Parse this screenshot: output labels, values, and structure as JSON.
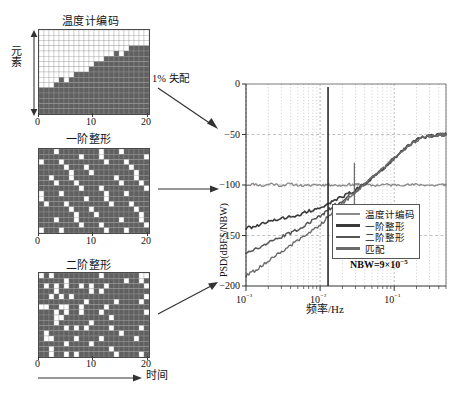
{
  "figure": {
    "panels": [
      {
        "id": "thermometer",
        "title": "温度计编码",
        "y_axis_label": "元素",
        "x_ticks": [
          "0",
          "10",
          "20"
        ]
      },
      {
        "id": "first-order",
        "title": "一阶整形",
        "x_ticks": [
          "0",
          "10",
          "20"
        ]
      },
      {
        "id": "second-order",
        "title": "二阶整形",
        "x_ticks": [
          "0",
          "10",
          "20"
        ]
      }
    ],
    "time_axis_label": "时间",
    "mismatch_annotation": "1%  失配"
  },
  "chart_data": {
    "type": "line",
    "title": "",
    "xlabel": "频率/Hz",
    "ylabel": "PSD(dBFS/NBW)",
    "xscale": "log",
    "xlim": [
      0.001,
      0.5
    ],
    "ylim": [
      -200,
      0
    ],
    "yticks": [
      0,
      -50,
      -100,
      -150,
      -200
    ],
    "ytick_labels": [
      "0",
      "−50",
      "−100",
      "−150",
      "−200"
    ],
    "xticks": [
      0.001,
      0.01,
      0.1
    ],
    "xtick_labels": [
      "10⁻³",
      "10⁻²",
      "10⁻¹"
    ],
    "grid": true,
    "annotation": "NBW=9×10",
    "annotation_exponent": "−5",
    "legend_position": "lower-right-inside",
    "series": [
      {
        "name": "温度计编码",
        "color": "#8a8a8a",
        "width": 1.3,
        "x": [
          0.001,
          0.0013,
          0.0017,
          0.0022,
          0.0029,
          0.0038,
          0.005,
          0.0065,
          0.0085,
          0.011,
          0.0128,
          0.0145,
          0.019,
          0.025,
          0.029,
          0.033,
          0.043,
          0.056,
          0.073,
          0.095,
          0.12,
          0.16,
          0.21,
          0.27,
          0.35,
          0.45,
          0.5
        ],
        "y": [
          -100,
          -99,
          -101,
          -98.5,
          -100.5,
          -99,
          -100,
          -101,
          -99.5,
          -100,
          -99.5,
          -100,
          -100.5,
          -99.5,
          -100,
          -99,
          -100,
          -100.5,
          -99.5,
          -100,
          -99.5,
          -100,
          -99.5,
          -100,
          -100.5,
          -99.5,
          -100
        ]
      },
      {
        "name": "一阶整形",
        "color": "#3a3a3a",
        "width": 1.6,
        "x": [
          0.001,
          0.0013,
          0.0017,
          0.0022,
          0.0029,
          0.0038,
          0.005,
          0.0065,
          0.0085,
          0.011,
          0.0128,
          0.016,
          0.021,
          0.027,
          0.035,
          0.045,
          0.058,
          0.075,
          0.098,
          0.13,
          0.17,
          0.22,
          0.29,
          0.38,
          0.45,
          0.5
        ],
        "y": [
          -143,
          -141,
          -138.5,
          -136,
          -133,
          -131.5,
          -130,
          -127,
          -124,
          -121,
          -118.5,
          -115,
          -111,
          -107,
          -102,
          -96,
          -89,
          -82,
          -74,
          -66,
          -59,
          -54,
          -51.5,
          -50.5,
          -50.2,
          -50
        ]
      },
      {
        "name": "二阶整形",
        "color": "#555555",
        "width": 1.5,
        "x": [
          0.001,
          0.0013,
          0.0017,
          0.0022,
          0.0029,
          0.0038,
          0.005,
          0.0065,
          0.0085,
          0.011,
          0.0128,
          0.016,
          0.021,
          0.027,
          0.035,
          0.045,
          0.058,
          0.075,
          0.098,
          0.13,
          0.17,
          0.22,
          0.29,
          0.38,
          0.45,
          0.5
        ],
        "y": [
          -167,
          -164,
          -160,
          -156,
          -152,
          -148,
          -144,
          -139,
          -134,
          -129,
          -125,
          -120,
          -114,
          -108,
          -102,
          -96,
          -89,
          -82,
          -74,
          -66,
          -59,
          -54,
          -51.5,
          -50.5,
          -50.2,
          -50
        ]
      },
      {
        "name": "匹配",
        "color": "#6b6b6b",
        "width": 1.4,
        "x": [
          0.001,
          0.0013,
          0.0017,
          0.0022,
          0.0029,
          0.0038,
          0.005,
          0.0065,
          0.0085,
          0.011,
          0.0128,
          0.016,
          0.021,
          0.027,
          0.035,
          0.045,
          0.058,
          0.075,
          0.098,
          0.13,
          0.17,
          0.22,
          0.29,
          0.38,
          0.45,
          0.5
        ],
        "y": [
          -190,
          -185,
          -179,
          -173,
          -167,
          -161,
          -155,
          -149,
          -143,
          -137,
          -131,
          -124,
          -117,
          -110,
          -103,
          -96,
          -89,
          -82,
          -74,
          -66,
          -59,
          -54,
          -51.5,
          -50.5,
          -50.2,
          -50
        ]
      }
    ],
    "spikes": [
      {
        "x": 0.0128,
        "y_top": -3,
        "y_bottom": -200,
        "color": "#2a2a2a",
        "width": 1.6
      },
      {
        "x": 0.029,
        "y_top": -78,
        "y_bottom": -122,
        "color": "#6a6a6a",
        "width": 1.2
      }
    ]
  },
  "grids": {
    "thermometer": {
      "cols": 22,
      "rows": 16,
      "heights": [
        5,
        5,
        6,
        6,
        7,
        7,
        7,
        8,
        8,
        9,
        9,
        11,
        10,
        12,
        11,
        13,
        11,
        12,
        13,
        13,
        13,
        13
      ],
      "notches": [
        {
          "col": 2,
          "row": 5
        },
        {
          "col": 5,
          "row": 6
        },
        {
          "col": 9,
          "row": 8
        },
        {
          "col": 11,
          "row": 10
        },
        {
          "col": 13,
          "row": 11
        },
        {
          "col": 15,
          "row": 12
        }
      ]
    },
    "first_order": {
      "cols": 22,
      "rows": 16,
      "pattern": "diagonal-stripes"
    },
    "second_order": {
      "cols": 22,
      "rows": 16,
      "pattern": "scattered"
    }
  },
  "colors": {
    "cell_on": "#606060",
    "cell_off": "#ffffff",
    "grid_line": "#9a9a9a",
    "axis": "#333333",
    "background": "#ffffff"
  }
}
